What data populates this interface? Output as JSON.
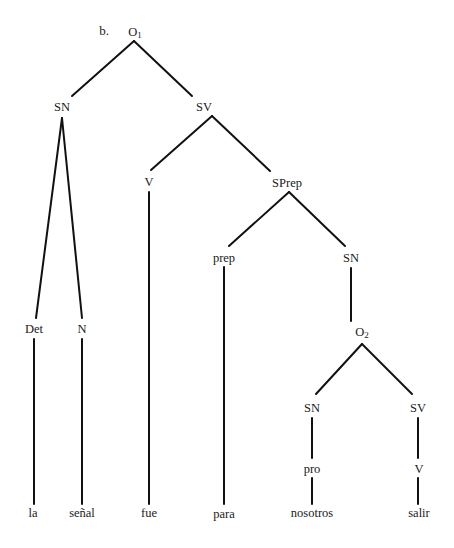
{
  "example_label": "b.",
  "nodes": [
    {
      "id": "O1",
      "text": "O",
      "sub": "1",
      "x": 135,
      "y": 33
    },
    {
      "id": "SN1",
      "text": "SN",
      "sub": "",
      "x": 62,
      "y": 107
    },
    {
      "id": "SV1",
      "text": "SV",
      "sub": "",
      "x": 204,
      "y": 107
    },
    {
      "id": "V1",
      "text": "V",
      "sub": "",
      "x": 149,
      "y": 182
    },
    {
      "id": "SPrep",
      "text": "SPrep",
      "sub": "",
      "x": 287,
      "y": 183
    },
    {
      "id": "prep",
      "text": "prep",
      "sub": "",
      "x": 224,
      "y": 258
    },
    {
      "id": "SN2",
      "text": "SN",
      "sub": "",
      "x": 351,
      "y": 258
    },
    {
      "id": "Det",
      "text": "Det",
      "sub": "",
      "x": 34,
      "y": 329
    },
    {
      "id": "N",
      "text": "N",
      "sub": "",
      "x": 82,
      "y": 329
    },
    {
      "id": "O2",
      "text": "O",
      "sub": "2",
      "x": 362,
      "y": 333
    },
    {
      "id": "SN3",
      "text": "SN",
      "sub": "",
      "x": 312,
      "y": 408
    },
    {
      "id": "SV2",
      "text": "SV",
      "sub": "",
      "x": 418,
      "y": 408
    },
    {
      "id": "pro",
      "text": "pro",
      "sub": "",
      "x": 312,
      "y": 469
    },
    {
      "id": "V2",
      "text": "V",
      "sub": "",
      "x": 419,
      "y": 469
    }
  ],
  "leaves": [
    {
      "text": "la",
      "x": 33,
      "y": 513
    },
    {
      "text": "señal",
      "x": 82,
      "y": 513
    },
    {
      "text": "fue",
      "x": 149,
      "y": 513
    },
    {
      "text": "para",
      "x": 224,
      "y": 514
    },
    {
      "text": "nosotros",
      "x": 312,
      "y": 513
    },
    {
      "text": "salir",
      "x": 419,
      "y": 513
    }
  ],
  "edges": [
    [
      134,
      41,
      72,
      96
    ],
    [
      134,
      41,
      192,
      96
    ],
    [
      62,
      118,
      36,
      318
    ],
    [
      62,
      118,
      82,
      318
    ],
    [
      212,
      116,
      151,
      170
    ],
    [
      212,
      116,
      270,
      171
    ],
    [
      149,
      192,
      149,
      504
    ],
    [
      289,
      192,
      229,
      246
    ],
    [
      289,
      192,
      345,
      246
    ],
    [
      224,
      267,
      224,
      504
    ],
    [
      351,
      268,
      351,
      321
    ],
    [
      34,
      339,
      34,
      504
    ],
    [
      82,
      339,
      82,
      504
    ],
    [
      362,
      344,
      316,
      394
    ],
    [
      362,
      344,
      412,
      394
    ],
    [
      312,
      418,
      312,
      458
    ],
    [
      418,
      418,
      418,
      458
    ],
    [
      312,
      478,
      312,
      504
    ],
    [
      418,
      478,
      418,
      504
    ]
  ]
}
